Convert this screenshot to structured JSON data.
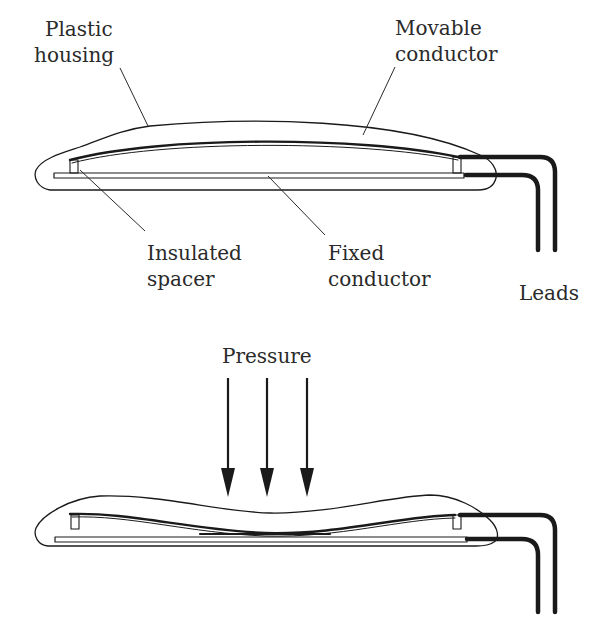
{
  "diagram": {
    "colors": {
      "ink": "#1a1a1a",
      "text": "#2a2a2a",
      "background": "#ffffff"
    },
    "top_view": {
      "state": "released",
      "labels": {
        "plastic_housing": {
          "line1": "Plastic",
          "line2": "housing"
        },
        "movable_conductor": {
          "line1": "Movable",
          "line2": "conductor"
        },
        "insulated_spacer": {
          "line1": "Insulated",
          "line2": "spacer"
        },
        "fixed_conductor": {
          "line1": "Fixed",
          "line2": "conductor"
        },
        "leads": {
          "line1": "Leads"
        }
      }
    },
    "bottom_view": {
      "state": "pressed",
      "labels": {
        "pressure": "Pressure"
      },
      "arrow_count": 3
    }
  }
}
